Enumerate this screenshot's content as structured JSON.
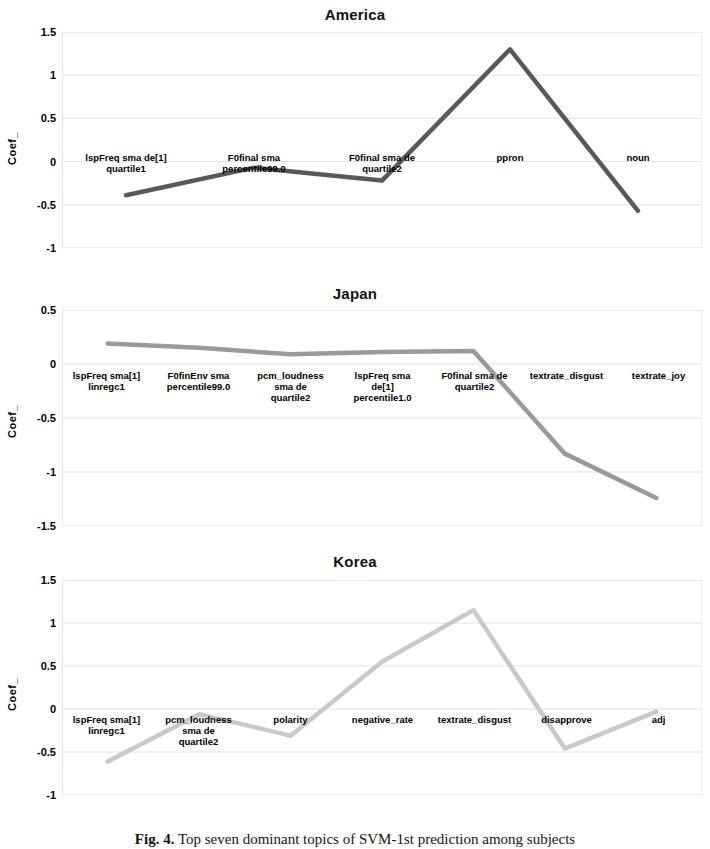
{
  "figure": {
    "caption_label": "Fig. 4.",
    "caption_text": "Top seven dominant topics of SVM-1st prediction among subjects"
  },
  "chart_data": [
    {
      "type": "line",
      "title": "America",
      "ylabel": "Coef_",
      "xlabel": "",
      "ylim": [
        -1,
        1.5
      ],
      "yticks": [
        1.5,
        1,
        0.5,
        0,
        -0.5,
        -1
      ],
      "ytick_labels": [
        "1.5",
        "1",
        "0.5",
        "0",
        "-0.5",
        "-1"
      ],
      "grid": true,
      "legend": "none",
      "line_color": "#595959",
      "categories": [
        "lspFreq sma de[1]\nquartile1",
        "F0final sma\npercentile99.0",
        "F0final sma de\nquartile2",
        "ppron",
        "noun"
      ],
      "values": [
        -0.39,
        -0.07,
        -0.22,
        1.3,
        -0.57
      ]
    },
    {
      "type": "line",
      "title": "Japan",
      "ylabel": "Coef_",
      "xlabel": "",
      "ylim": [
        -1.5,
        0.5
      ],
      "yticks": [
        0.5,
        0,
        -0.5,
        -1,
        -1.5
      ],
      "ytick_labels": [
        "0.5",
        "0",
        "-0.5",
        "-1",
        "-1.5"
      ],
      "grid": true,
      "legend": "none",
      "line_color": "#9a9a9a",
      "categories": [
        "lspFreq sma[1]\nlinregc1",
        "F0finEnv sma\npercentile99.0",
        "pcm_loudness\nsma de\nquartile2",
        "lspFreq sma\nde[1]\npercentile1.0",
        "F0final sma de\nquartile2",
        "textrate_disgust",
        "textrate_joy"
      ],
      "values": [
        0.19,
        0.15,
        0.09,
        0.11,
        0.12,
        -0.83,
        -1.24
      ]
    },
    {
      "type": "line",
      "title": "Korea",
      "ylabel": "Coef_",
      "xlabel": "",
      "ylim": [
        -1,
        1.5
      ],
      "yticks": [
        1.5,
        1,
        0.5,
        0,
        -0.5,
        -1
      ],
      "ytick_labels": [
        "1.5",
        "1",
        "0.5",
        "0",
        "-0.5",
        "-1"
      ],
      "grid": true,
      "legend": "none",
      "line_color": "#c9c9c9",
      "categories": [
        "lspFreq sma[1]\nlinregc1",
        "pcm_loudness\nsma de\nquartile2",
        "polarity",
        "negative_rate",
        "textrate_disgust",
        "disapprove",
        "adj"
      ],
      "values": [
        -0.61,
        -0.06,
        -0.31,
        0.55,
        1.15,
        -0.46,
        -0.03
      ]
    }
  ]
}
